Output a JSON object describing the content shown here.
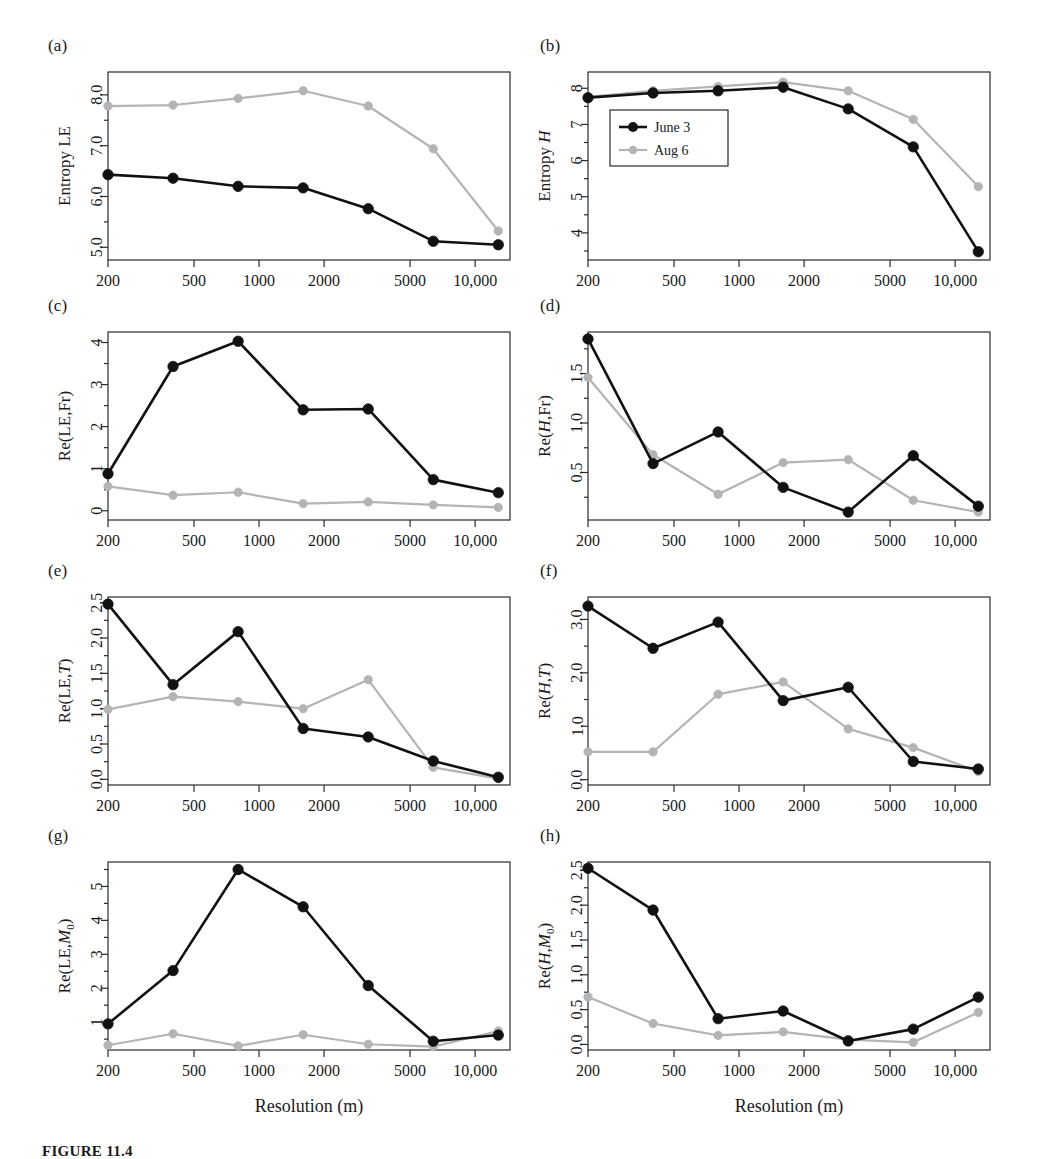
{
  "figure": {
    "caption": "FIGURE 11.4",
    "xlabel": "Resolution (m)",
    "panel_labels": [
      "(a)",
      "(b)",
      "(c)",
      "(d)",
      "(e)",
      "(f)",
      "(g)",
      "(h)"
    ]
  },
  "legend": {
    "position": "inside-top-left-of-panel-b",
    "entries": [
      {
        "label": "June 3",
        "color": "#111111",
        "marker": "circle"
      },
      {
        "label": "Aug 6",
        "color": "#b4b4b4",
        "marker": "circle"
      }
    ]
  },
  "colors": {
    "june3": "#111111",
    "aug6": "#b4b4b4",
    "axis": "#2b2b2b",
    "background": "#ffffff"
  },
  "chart_data": [
    {
      "panel": "(a)",
      "type": "line",
      "title": "",
      "xlabel": "Resolution (m)",
      "ylabel": "Entropy LE",
      "xscale": "log",
      "x": [
        200,
        400,
        800,
        1600,
        3200,
        6400,
        12800
      ],
      "xticks": [
        200,
        500,
        1000,
        2000,
        5000,
        10000
      ],
      "xticklabels": [
        "200",
        "500",
        "1000",
        "2000",
        "5000",
        "10,000"
      ],
      "yticks": [
        5.0,
        6.0,
        7.0,
        8.0
      ],
      "yticklabels": [
        "5.0",
        "6.0",
        "7.0",
        "8.0"
      ],
      "ylim": [
        4.75,
        8.45
      ],
      "grid": false,
      "series": [
        {
          "name": "June 3",
          "values": [
            6.43,
            6.36,
            6.2,
            6.17,
            5.76,
            5.12,
            5.05
          ]
        },
        {
          "name": "Aug 6",
          "values": [
            7.78,
            7.8,
            7.93,
            8.08,
            7.78,
            6.94,
            5.32
          ]
        }
      ]
    },
    {
      "panel": "(b)",
      "type": "line",
      "title": "",
      "xlabel": "Resolution (m)",
      "ylabel": "Entropy H",
      "xscale": "log",
      "x": [
        200,
        400,
        800,
        1600,
        3200,
        6400,
        12800
      ],
      "xticks": [
        200,
        500,
        1000,
        2000,
        5000,
        10000
      ],
      "xticklabels": [
        "200",
        "500",
        "1000",
        "2000",
        "5000",
        "10,000"
      ],
      "yticks": [
        4,
        5,
        6,
        7,
        8
      ],
      "yticklabels": [
        "4",
        "5",
        "6",
        "7",
        "8"
      ],
      "ylim": [
        3.25,
        8.45
      ],
      "grid": false,
      "series": [
        {
          "name": "June 3",
          "values": [
            7.74,
            7.87,
            7.93,
            8.03,
            7.43,
            6.38,
            3.48
          ]
        },
        {
          "name": "Aug 6",
          "values": [
            7.76,
            7.93,
            8.05,
            8.17,
            7.93,
            7.14,
            5.28
          ]
        }
      ]
    },
    {
      "panel": "(c)",
      "type": "line",
      "title": "",
      "xlabel": "Resolution (m)",
      "ylabel": "Re(LE,Fr)",
      "xscale": "log",
      "x": [
        200,
        400,
        800,
        1600,
        3200,
        6400,
        12800
      ],
      "xticks": [
        200,
        500,
        1000,
        2000,
        5000,
        10000
      ],
      "xticklabels": [
        "200",
        "500",
        "1000",
        "2000",
        "5000",
        "10,000"
      ],
      "yticks": [
        0,
        1,
        2,
        3,
        4
      ],
      "yticklabels": [
        "0",
        "1",
        "2",
        "3",
        "4"
      ],
      "ylim": [
        -0.22,
        4.25
      ],
      "grid": false,
      "series": [
        {
          "name": "June 3",
          "values": [
            0.88,
            3.43,
            4.03,
            2.4,
            2.42,
            0.74,
            0.43
          ]
        },
        {
          "name": "Aug 6",
          "values": [
            0.58,
            0.37,
            0.44,
            0.17,
            0.21,
            0.14,
            0.08
          ]
        }
      ]
    },
    {
      "panel": "(d)",
      "type": "line",
      "title": "",
      "xlabel": "Resolution (m)",
      "ylabel": "Re(H,Fr)",
      "xscale": "log",
      "x": [
        200,
        400,
        800,
        1600,
        3200,
        6400,
        12800
      ],
      "xticks": [
        200,
        500,
        1000,
        2000,
        5000,
        10000
      ],
      "xticklabels": [
        "200",
        "500",
        "1000",
        "2000",
        "5000",
        "10,000"
      ],
      "yticks": [
        0.5,
        1.0,
        1.5
      ],
      "yticklabels": [
        "0.5",
        "1.0",
        "1.5"
      ],
      "ylim": [
        0.02,
        1.92
      ],
      "grid": false,
      "series": [
        {
          "name": "June 3",
          "values": [
            1.85,
            0.59,
            0.91,
            0.35,
            0.1,
            0.67,
            0.16
          ]
        },
        {
          "name": "Aug 6",
          "values": [
            1.46,
            0.68,
            0.28,
            0.6,
            0.63,
            0.22,
            0.1
          ]
        }
      ]
    },
    {
      "panel": "(e)",
      "type": "line",
      "title": "",
      "xlabel": "Resolution (m)",
      "ylabel": "Re(LE,T)",
      "xscale": "log",
      "x": [
        200,
        400,
        800,
        1600,
        3200,
        6400,
        12800
      ],
      "xticks": [
        200,
        500,
        1000,
        2000,
        5000,
        10000
      ],
      "xticklabels": [
        "200",
        "500",
        "1000",
        "2000",
        "5000",
        "10,000"
      ],
      "yticks": [
        0.0,
        0.5,
        1.0,
        1.5,
        2.0,
        2.5
      ],
      "yticklabels": [
        "0.0",
        "0.5",
        "1.0",
        "1.5",
        "2.0",
        "2.5"
      ],
      "ylim": [
        -0.08,
        2.58
      ],
      "grid": false,
      "series": [
        {
          "name": "June 3",
          "values": [
            2.48,
            1.34,
            2.09,
            0.72,
            0.6,
            0.26,
            0.03
          ]
        },
        {
          "name": "Aug 6",
          "values": [
            0.99,
            1.17,
            1.1,
            1.0,
            1.41,
            0.17,
            0.01
          ]
        }
      ]
    },
    {
      "panel": "(f)",
      "type": "line",
      "title": "",
      "xlabel": "Resolution (m)",
      "ylabel": "Re(H,T)",
      "xscale": "log",
      "x": [
        200,
        400,
        800,
        1600,
        3200,
        6400,
        12800
      ],
      "xticks": [
        200,
        500,
        1000,
        2000,
        5000,
        10000
      ],
      "xticklabels": [
        "200",
        "500",
        "1000",
        "2000",
        "5000",
        "10,000"
      ],
      "yticks": [
        0.0,
        1.0,
        2.0,
        3.0
      ],
      "yticklabels": [
        "0.0",
        "1.0",
        "2.0",
        "3.0"
      ],
      "ylim": [
        -0.1,
        3.42
      ],
      "grid": false,
      "series": [
        {
          "name": "June 3",
          "values": [
            3.25,
            2.46,
            2.95,
            1.48,
            1.73,
            0.34,
            0.2
          ]
        },
        {
          "name": "Aug 6",
          "values": [
            0.52,
            0.52,
            1.6,
            1.83,
            0.95,
            0.6,
            0.15
          ]
        }
      ]
    },
    {
      "panel": "(g)",
      "type": "line",
      "title": "",
      "xlabel": "Resolution (m)",
      "ylabel": "Re(LE,M0)",
      "xscale": "log",
      "x": [
        200,
        400,
        800,
        1600,
        3200,
        6400,
        12800
      ],
      "xticks": [
        200,
        500,
        1000,
        2000,
        5000,
        10000
      ],
      "xticklabels": [
        "200",
        "500",
        "1000",
        "2000",
        "5000",
        "10,000"
      ],
      "yticks": [
        1,
        2,
        3,
        4,
        5
      ],
      "yticklabels": [
        "1",
        "2",
        "3",
        "4",
        "5"
      ],
      "ylim": [
        0.18,
        5.72
      ],
      "grid": false,
      "series": [
        {
          "name": "June 3",
          "values": [
            0.95,
            2.52,
            5.5,
            4.4,
            2.08,
            0.44,
            0.62
          ]
        },
        {
          "name": "Aug 6",
          "values": [
            0.32,
            0.66,
            0.3,
            0.63,
            0.35,
            0.28,
            0.74
          ]
        }
      ]
    },
    {
      "panel": "(h)",
      "type": "line",
      "title": "",
      "xlabel": "Resolution (m)",
      "ylabel": "Re(H,M0)",
      "xscale": "log",
      "x": [
        200,
        400,
        800,
        1600,
        3200,
        6400,
        12800
      ],
      "xticks": [
        200,
        500,
        1000,
        2000,
        5000,
        10000
      ],
      "xticklabels": [
        "200",
        "500",
        "1000",
        "2000",
        "5000",
        "10,000"
      ],
      "yticks": [
        0.0,
        0.5,
        1.0,
        1.5,
        2.0,
        2.5
      ],
      "yticklabels": [
        "0.0",
        "0.5",
        "1.0",
        "1.5",
        "2.0",
        "2.5"
      ],
      "ylim": [
        -0.08,
        2.62
      ],
      "grid": false,
      "series": [
        {
          "name": "June 3",
          "values": [
            2.53,
            1.93,
            0.37,
            0.48,
            0.05,
            0.22,
            0.68
          ]
        },
        {
          "name": "Aug 6",
          "values": [
            0.68,
            0.3,
            0.13,
            0.18,
            0.07,
            0.03,
            0.46
          ]
        }
      ]
    }
  ]
}
